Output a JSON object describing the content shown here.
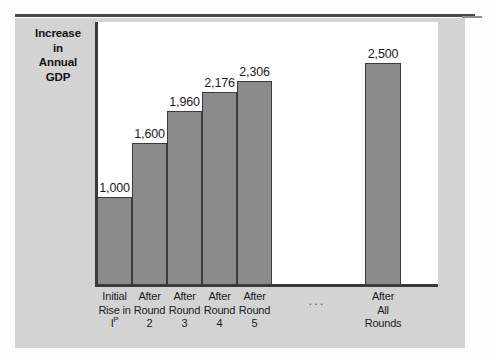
{
  "figure": {
    "y_axis_title_lines": [
      "Increase",
      "in",
      "Annual",
      "GDP"
    ],
    "ellipsis": "...",
    "colors": {
      "bar_fill": "#8b8b8b",
      "bar_outline": "#3b3b3b",
      "panel_background": "#d3d3d3",
      "plot_background": "#ffffff",
      "axis": "#3a3a3a",
      "rule": "#4a4a4a"
    }
  },
  "chart_data": {
    "type": "bar",
    "title": "",
    "subtitle": "",
    "xlabel": "",
    "ylabel": "Increase in Annual GDP",
    "ylim": [
      0,
      2700
    ],
    "grid": false,
    "legend": "none",
    "categories": [
      "Initial Rise in Iᵖ",
      "After Round 2",
      "After Round 3",
      "After Round 4",
      "After Round 5",
      "After All Rounds"
    ],
    "category_label_lines": [
      [
        "Initial",
        "Rise in",
        "Iᵖ"
      ],
      [
        "After",
        "Round",
        "2"
      ],
      [
        "After",
        "Round",
        "3"
      ],
      [
        "After",
        "Round",
        "4"
      ],
      [
        "After",
        "Round",
        "5"
      ],
      [
        "After",
        "All",
        "Rounds"
      ]
    ],
    "values": [
      1000,
      1600,
      1960,
      2176,
      2306,
      2500
    ],
    "data_labels": [
      "1,000",
      "1,600",
      "1,960",
      "2,176",
      "2,306",
      "2,500"
    ],
    "annotations": [
      "..."
    ]
  }
}
